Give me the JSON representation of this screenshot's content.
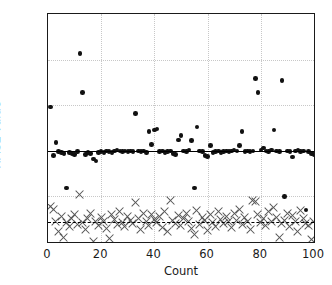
{
  "chart_data": {
    "type": "scatter",
    "title": "",
    "xlabel": "Count",
    "ylabel": "RMSE value",
    "xlim": [
      0,
      100
    ],
    "ylim": [
      0.0,
      2.5
    ],
    "xticks": [
      0,
      20,
      40,
      60,
      80,
      100
    ],
    "yticks": [
      0.0,
      0.5,
      1.0,
      1.5,
      2.0,
      2.5
    ],
    "ytick_labels": [
      "0.0",
      "0.5",
      "1.0",
      "1.5",
      "2.0",
      "2.5"
    ],
    "xtick_labels": [
      "0",
      "20",
      "40",
      "60",
      "80",
      "100"
    ],
    "grid": true,
    "grid_style": "dotted",
    "legend": null,
    "reference_lines": [
      {
        "name": "mean-rmse-circles",
        "y": 1.0,
        "style": "solid",
        "color": "#000000"
      },
      {
        "name": "mean-rmse-crosses",
        "y": 0.22,
        "style": "dashed",
        "color": "#000000"
      }
    ],
    "series": [
      {
        "name": "RMSE circles",
        "marker": "circle",
        "color": "#111111",
        "x": [
          1,
          2,
          3,
          4,
          5,
          6,
          7,
          8,
          9,
          10,
          11,
          12,
          13,
          14,
          15,
          16,
          17,
          18,
          19,
          20,
          21,
          22,
          23,
          24,
          25,
          26,
          27,
          28,
          29,
          30,
          31,
          32,
          33,
          34,
          35,
          36,
          37,
          38,
          39,
          40,
          41,
          42,
          43,
          44,
          45,
          46,
          47,
          48,
          49,
          50,
          51,
          52,
          53,
          54,
          55,
          56,
          57,
          58,
          59,
          60,
          61,
          62,
          63,
          64,
          65,
          66,
          67,
          68,
          69,
          70,
          71,
          72,
          73,
          74,
          75,
          76,
          77,
          78,
          79,
          80,
          81,
          82,
          83,
          84,
          85,
          86,
          87,
          88,
          89,
          90,
          91,
          92,
          93,
          94,
          95,
          96,
          97,
          98,
          99,
          100
        ],
        "y": [
          1.48,
          0.95,
          1.09,
          0.99,
          0.98,
          0.97,
          0.59,
          0.98,
          0.97,
          0.96,
          0.99,
          2.07,
          1.64,
          0.96,
          0.98,
          0.97,
          0.91,
          0.89,
          0.98,
          0.99,
          0.98,
          1.0,
          0.99,
          0.98,
          1.0,
          1.01,
          1.0,
          0.99,
          1.0,
          0.99,
          1.0,
          0.99,
          1.41,
          1.0,
          0.99,
          1.0,
          0.98,
          1.21,
          1.07,
          1.23,
          1.24,
          0.99,
          1.0,
          0.98,
          0.99,
          1.0,
          0.97,
          0.96,
          1.12,
          1.17,
          1.0,
          0.99,
          1.01,
          1.11,
          0.59,
          1.26,
          1.0,
          0.99,
          0.95,
          0.94,
          1.06,
          0.98,
          0.99,
          1.0,
          0.98,
          0.99,
          1.0,
          0.99,
          1.0,
          1.01,
          1.0,
          1.06,
          1.21,
          0.99,
          1.0,
          0.99,
          1.0,
          1.79,
          1.64,
          1.01,
          1.03,
          1.0,
          0.99,
          1.01,
          1.23,
          1.0,
          0.99,
          1.77,
          0.5,
          1.0,
          0.99,
          0.93,
          1.0,
          1.01,
          0.99,
          1.0,
          0.35,
          0.99,
          0.97,
          0.96
        ]
      },
      {
        "name": "RMSE crosses",
        "marker": "x",
        "color": "#555555",
        "x": [
          1,
          2,
          3,
          4,
          5,
          6,
          7,
          8,
          9,
          10,
          11,
          12,
          13,
          14,
          15,
          16,
          17,
          18,
          19,
          20,
          21,
          22,
          23,
          24,
          25,
          26,
          27,
          28,
          29,
          30,
          31,
          32,
          33,
          34,
          35,
          36,
          37,
          38,
          39,
          40,
          41,
          42,
          43,
          44,
          45,
          46,
          47,
          48,
          49,
          50,
          51,
          52,
          53,
          54,
          55,
          56,
          57,
          58,
          59,
          60,
          61,
          62,
          63,
          64,
          65,
          66,
          67,
          68,
          69,
          70,
          71,
          72,
          73,
          74,
          75,
          76,
          77,
          78,
          79,
          80,
          81,
          82,
          83,
          84,
          85,
          86,
          87,
          88,
          89,
          90,
          91,
          92,
          93,
          94,
          95,
          96,
          97,
          98,
          99,
          100
        ],
        "y": [
          0.39,
          0.36,
          0.23,
          0.12,
          0.28,
          0.05,
          0.21,
          0.17,
          0.26,
          0.3,
          0.19,
          0.52,
          0.21,
          0.14,
          0.26,
          0.31,
          0.01,
          0.22,
          0.18,
          0.27,
          0.23,
          0.15,
          0.04,
          0.3,
          0.25,
          0.19,
          0.33,
          0.21,
          0.17,
          0.28,
          0.24,
          0.2,
          0.43,
          0.26,
          0.14,
          0.31,
          0.22,
          0.18,
          0.3,
          0.25,
          0.21,
          0.28,
          0.16,
          0.33,
          0.12,
          0.45,
          0.24,
          0.2,
          0.29,
          0.18,
          0.26,
          0.31,
          0.22,
          0.15,
          0.08,
          0.35,
          0.19,
          0.27,
          0.24,
          0.13,
          0.3,
          0.21,
          0.17,
          0.33,
          0.25,
          0.2,
          0.28,
          0.22,
          0.16,
          0.31,
          0.24,
          0.36,
          0.19,
          0.27,
          0.23,
          0.14,
          0.45,
          0.44,
          0.3,
          0.21,
          0.26,
          0.18,
          0.33,
          0.22,
          0.38,
          0.27,
          0.05,
          0.2,
          0.24,
          0.31,
          0.17,
          0.29,
          0.23,
          0.12,
          0.35,
          0.26,
          0.2,
          0.18,
          0.03,
          0.22
        ]
      }
    ]
  }
}
